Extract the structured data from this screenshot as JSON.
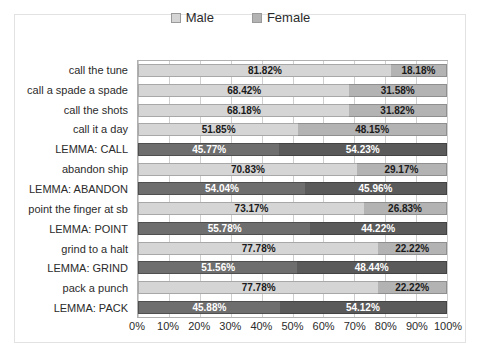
{
  "chart_data": {
    "type": "bar",
    "subtype": "stacked-horizontal-100pct",
    "title": "",
    "xlabel": "",
    "ylabel": "",
    "xlim": [
      0,
      100
    ],
    "grid": true,
    "legend_position": "top-center",
    "categories": [
      "call the tune",
      "call a spade a spade",
      "call the shots",
      "call it a day",
      "LEMMA: CALL",
      "abandon ship",
      "LEMMA: ABANDON",
      "point the finger at sb",
      "LEMMA: POINT",
      "grind to a halt",
      "LEMMA: GRIND",
      "pack a punch",
      "LEMMA: PACK"
    ],
    "series": [
      {
        "name": "Male",
        "color": "#d5d5d5",
        "values": [
          81.82,
          68.42,
          68.18,
          51.85,
          45.77,
          70.83,
          54.04,
          73.17,
          55.78,
          77.78,
          51.56,
          77.78,
          45.88
        ],
        "labels": [
          "81.82%",
          "68.42%",
          "68.18%",
          "51.85%",
          "45.77%",
          "70.83%",
          "54.04%",
          "73.17%",
          "55.78%",
          "77.78%",
          "51.56%",
          "77.78%",
          "45.88%"
        ]
      },
      {
        "name": "Female",
        "color": "#b3b3b3",
        "values": [
          18.18,
          31.58,
          31.82,
          48.15,
          54.23,
          29.17,
          45.96,
          26.83,
          44.22,
          22.22,
          48.44,
          22.22,
          54.12
        ],
        "labels": [
          "18.18%",
          "31.58%",
          "31.82%",
          "48.15%",
          "54.23%",
          "29.17%",
          "45.96%",
          "26.83%",
          "44.22%",
          "22.22%",
          "48.44%",
          "22.22%",
          "54.12%"
        ]
      }
    ],
    "highlighted_rows": [
      4,
      6,
      8,
      10,
      12
    ],
    "xticks": [
      0,
      10,
      20,
      30,
      40,
      50,
      60,
      70,
      80,
      90,
      100
    ],
    "xtick_labels": [
      "0%",
      "10%",
      "20%",
      "30%",
      "40%",
      "50%",
      "60%",
      "70%",
      "80%",
      "90%",
      "100%"
    ]
  },
  "legend": {
    "items": [
      {
        "label": "Male",
        "color": "#d5d5d5"
      },
      {
        "label": "Female",
        "color": "#b3b3b3"
      }
    ]
  }
}
